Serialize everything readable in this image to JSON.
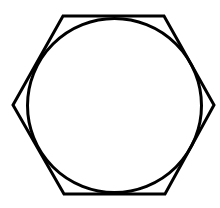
{
  "diagram": {
    "canvas": {
      "width": 220,
      "height": 208,
      "background": "#ffffff"
    },
    "stroke_color": "#000000",
    "stroke_width": 3,
    "hexagon": {
      "points": [
        [
          63,
          16
        ],
        [
          164,
          16
        ],
        [
          214,
          105
        ],
        [
          165,
          194
        ],
        [
          64,
          194
        ],
        [
          13,
          105
        ]
      ]
    },
    "circle": {
      "cx": 114.5,
      "cy": 105.5,
      "r": 87
    }
  }
}
